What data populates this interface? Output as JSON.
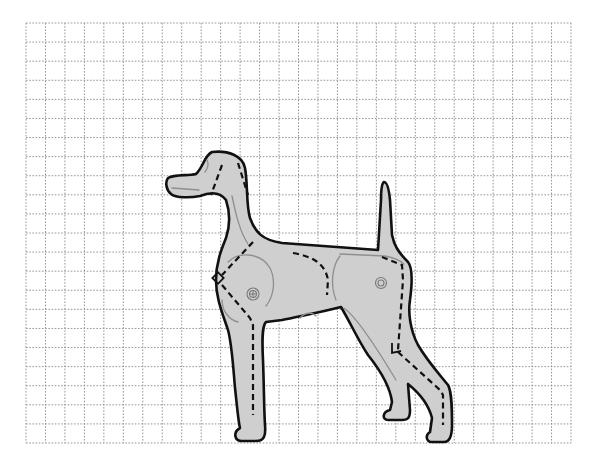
{
  "figure": {
    "colors": {
      "background": "#ffffff",
      "grid": "#8a8a8a",
      "body_fill": "#cfcfcf",
      "outline": "#111111",
      "muscle_lines": "#8f8f8f"
    },
    "grid": {
      "x_start": 26,
      "y_start": 23,
      "x_end": 571,
      "y_end": 443,
      "columns": 28,
      "rows": 22,
      "style": "dotted"
    },
    "annotations": {
      "dashed_cut_lines": [
        "neck-front",
        "neck-back",
        "shoulder-chest",
        "front-leg",
        "back-flank",
        "rear-thigh",
        "hock-to-foot"
      ],
      "square_markers": [
        "chest-point-marker",
        "hock-marker"
      ],
      "joint_symbols": [
        "shoulder-joint-circle",
        "hip-joint-circle"
      ]
    }
  }
}
